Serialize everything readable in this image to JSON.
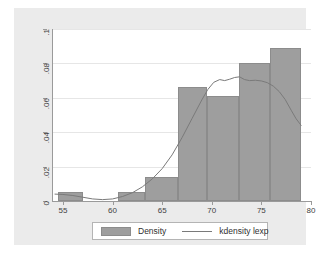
{
  "chart_data": {
    "type": "bar",
    "title": "",
    "subtitle": "",
    "xlabel": "",
    "ylabel": "",
    "xlim": [
      54.0,
      80.0
    ],
    "ylim": [
      0,
      0.1
    ],
    "grid": true,
    "grid_axis": "y",
    "legend_position": "bottom",
    "x_ticks": [
      55,
      60,
      65,
      70,
      75,
      80
    ],
    "x_tick_labels": [
      "55",
      "60",
      "65",
      "70",
      "75",
      "80"
    ],
    "y_ticks": [
      0,
      0.02,
      0.04,
      0.06,
      0.08,
      0.1
    ],
    "y_tick_labels": [
      "0",
      ".02",
      ".04",
      ".06",
      ".08",
      ".1"
    ],
    "series": [
      {
        "name": "Density",
        "type": "histogram",
        "color": "#9e9e9e",
        "edge_color": "#8c8c8c",
        "bins": [
          {
            "x0": 54.5,
            "x1": 57.0,
            "height": 0.005
          },
          {
            "x0": 60.5,
            "x1": 63.3,
            "height": 0.005
          },
          {
            "x0": 63.3,
            "x1": 66.6,
            "height": 0.014
          },
          {
            "x0": 66.6,
            "x1": 69.5,
            "height": 0.066
          },
          {
            "x0": 69.5,
            "x1": 72.7,
            "height": 0.061
          },
          {
            "x0": 72.7,
            "x1": 75.9,
            "height": 0.08
          },
          {
            "x0": 75.9,
            "x1": 79.0,
            "height": 0.089
          }
        ]
      },
      {
        "name": "kdensity lexp",
        "type": "line",
        "color": "#7a7a7a",
        "points": [
          [
            54.2,
            0.004
          ],
          [
            55.0,
            0.0038
          ],
          [
            56.0,
            0.0032
          ],
          [
            57.0,
            0.0022
          ],
          [
            58.0,
            0.0012
          ],
          [
            59.0,
            0.0008
          ],
          [
            60.0,
            0.0012
          ],
          [
            61.0,
            0.0026
          ],
          [
            62.0,
            0.0048
          ],
          [
            63.0,
            0.0082
          ],
          [
            64.0,
            0.0128
          ],
          [
            65.0,
            0.0188
          ],
          [
            66.0,
            0.0268
          ],
          [
            67.0,
            0.0368
          ],
          [
            68.0,
            0.0478
          ],
          [
            69.0,
            0.0588
          ],
          [
            69.6,
            0.0648
          ],
          [
            70.2,
            0.069
          ],
          [
            70.8,
            0.0706
          ],
          [
            71.3,
            0.07
          ],
          [
            71.8,
            0.0708
          ],
          [
            72.3,
            0.0718
          ],
          [
            72.8,
            0.0722
          ],
          [
            73.3,
            0.0706
          ],
          [
            73.8,
            0.07
          ],
          [
            74.4,
            0.0702
          ],
          [
            75.0,
            0.0698
          ],
          [
            75.6,
            0.0688
          ],
          [
            76.2,
            0.0668
          ],
          [
            76.8,
            0.0636
          ],
          [
            77.4,
            0.059
          ],
          [
            78.0,
            0.0528
          ],
          [
            78.5,
            0.0478
          ],
          [
            79.0,
            0.044
          ]
        ]
      }
    ]
  },
  "legend": {
    "items": [
      {
        "label": "Density",
        "marker": "swatch"
      },
      {
        "label": "kdensity lexp",
        "marker": "line"
      }
    ]
  },
  "colors": {
    "bar_fill": "#9e9e9e",
    "bar_edge": "#8c8c8c",
    "line": "#7a7a7a",
    "plot_background": "#ffffff",
    "graph_background": "#ebebeb",
    "gridline": "#e6e6e6",
    "axis": "#9a9a9a",
    "text": "#3f3f3f"
  }
}
